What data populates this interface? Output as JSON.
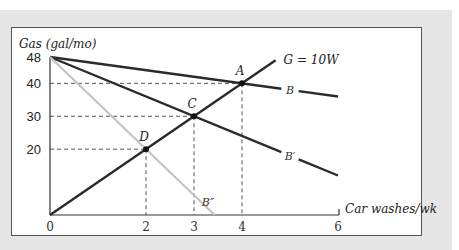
{
  "chart_data": {
    "type": "line",
    "title": "",
    "xlabel": "Car washes/wk",
    "ylabel": "Gas (gal/mo)",
    "xlim": [
      0,
      6
    ],
    "ylim": [
      0,
      48
    ],
    "x_ticks": [
      0,
      2,
      3,
      4,
      6
    ],
    "y_ticks": [
      20,
      30,
      40,
      48
    ],
    "grid": false,
    "series": [
      {
        "name": "B",
        "label": "B",
        "color": "#2b2b2b",
        "points": [
          [
            0,
            48
          ],
          [
            6,
            36
          ]
        ],
        "label_at": [
          5,
          38
        ]
      },
      {
        "name": "B'",
        "label": "B′",
        "color": "#2b2b2b",
        "points": [
          [
            0,
            48
          ],
          [
            6,
            12
          ]
        ],
        "label_at": [
          5,
          18
        ]
      },
      {
        "name": "B''",
        "label": "B″",
        "color": "#c4c4c4",
        "points": [
          [
            0,
            48
          ],
          [
            3.43,
            0
          ]
        ],
        "label_at": [
          3.1,
          4
        ]
      },
      {
        "name": "G = 10W",
        "label": "G = 10W",
        "color": "#2b2b2b",
        "points": [
          [
            0,
            0
          ],
          [
            4.7,
            47
          ]
        ],
        "label_at": [
          4.7,
          47
        ]
      }
    ],
    "points": [
      {
        "label": "A",
        "x": 4,
        "y": 40
      },
      {
        "label": "C",
        "x": 3,
        "y": 30
      },
      {
        "label": "D",
        "x": 2,
        "y": 20
      }
    ],
    "reference_lines": [
      {
        "x": 4,
        "y": 40
      },
      {
        "x": 3,
        "y": 30
      },
      {
        "x": 2,
        "y": 20
      }
    ]
  }
}
